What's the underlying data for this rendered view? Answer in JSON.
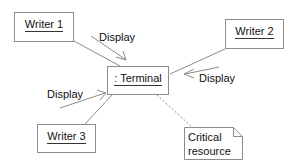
{
  "diagram": {
    "background_color": "#ffffff",
    "border_color": "#8c8c8c",
    "line_color": "#8c8c8c",
    "text_color": "#111111",
    "nodes": [
      {
        "id": "writer1",
        "label": "Writer 1",
        "underlined": true,
        "x": 14,
        "y": 12,
        "w": 60,
        "h": 30
      },
      {
        "id": "writer2",
        "label": "Writer 2",
        "underlined": true,
        "x": 225,
        "y": 19,
        "w": 59,
        "h": 30
      },
      {
        "id": "terminal",
        "label": ": Terminal",
        "underlined": true,
        "x": 107,
        "y": 66,
        "w": 62,
        "h": 29
      },
      {
        "id": "writer3",
        "label": "Writer 3",
        "underlined": true,
        "x": 37,
        "y": 124,
        "w": 59,
        "h": 29
      }
    ],
    "notes": [
      {
        "id": "critical-resource",
        "lines": [
          "Critical",
          "resource"
        ],
        "x": 184,
        "y": 127,
        "w": 59,
        "h": 33,
        "fold": 9
      }
    ],
    "edge_labels": [
      {
        "id": "display-writer1",
        "text": "Display",
        "x": 99,
        "y": 31
      },
      {
        "id": "display-writer2",
        "text": "Display",
        "x": 199,
        "y": 72
      },
      {
        "id": "display-writer3",
        "text": "Display",
        "x": 47,
        "y": 88
      }
    ],
    "links": [
      {
        "id": "link-writer1-terminal",
        "from": "writer1",
        "to": "terminal",
        "style": "solid"
      },
      {
        "id": "link-writer2-terminal",
        "from": "writer2",
        "to": "terminal",
        "style": "solid"
      },
      {
        "id": "link-writer3-terminal",
        "from": "writer3",
        "to": "terminal",
        "style": "solid"
      },
      {
        "id": "link-terminal-critical-resource",
        "from": "terminal",
        "to": "critical-resource",
        "style": "dashed"
      }
    ],
    "messages": [
      {
        "id": "message-display-1",
        "name": "Display",
        "direction": "writer1-to-terminal"
      },
      {
        "id": "message-display-2",
        "name": "Display",
        "direction": "writer2-to-terminal"
      },
      {
        "id": "message-display-3",
        "name": "Display",
        "direction": "writer3-to-terminal"
      }
    ]
  }
}
